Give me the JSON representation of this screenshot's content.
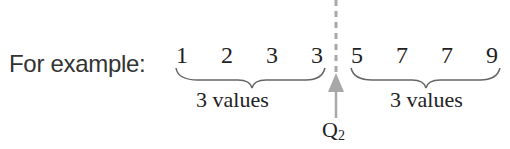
{
  "intro_label": "For example:",
  "lower_group": {
    "values": [
      "1",
      "2",
      "3",
      "3"
    ],
    "caption": "3 values"
  },
  "upper_group": {
    "values": [
      "5",
      "7",
      "7",
      "9"
    ],
    "caption": "3 values"
  },
  "marker": {
    "label": "Q",
    "subscript": "2"
  },
  "colors": {
    "arrow": "#a8a8a8",
    "dashed_line": "#a8a8a8",
    "brace": "#666666",
    "text": "#222222"
  }
}
